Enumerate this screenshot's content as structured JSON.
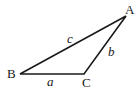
{
  "diagram": {
    "type": "triangle",
    "vertices": [
      {
        "label": "A",
        "x": 126,
        "y": 16
      },
      {
        "label": "B",
        "x": 20,
        "y": 74
      },
      {
        "label": "C",
        "x": 84,
        "y": 74
      }
    ],
    "sides": [
      {
        "label": "a",
        "from": "B",
        "to": "C"
      },
      {
        "label": "b",
        "from": "C",
        "to": "A"
      },
      {
        "label": "c",
        "from": "B",
        "to": "A"
      }
    ]
  },
  "labels": {
    "vertex_a": "A",
    "vertex_b": "B",
    "vertex_c": "C",
    "side_a": "a",
    "side_b": "b",
    "side_c": "c"
  }
}
